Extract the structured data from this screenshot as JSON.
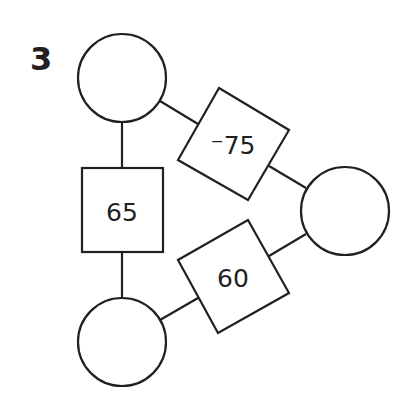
{
  "problem": {
    "number": "3"
  },
  "diagram": {
    "stroke_color": "#231f20",
    "circles": [
      {
        "id": "top",
        "value": ""
      },
      {
        "id": "right",
        "value": ""
      },
      {
        "id": "bottom",
        "value": ""
      }
    ],
    "boxes": [
      {
        "id": "top-bottom",
        "connects": [
          "top",
          "bottom"
        ],
        "value": "65"
      },
      {
        "id": "top-right",
        "connects": [
          "top",
          "right"
        ],
        "value": "⁻75"
      },
      {
        "id": "right-bottom",
        "connects": [
          "right",
          "bottom"
        ],
        "value": "60"
      }
    ]
  }
}
